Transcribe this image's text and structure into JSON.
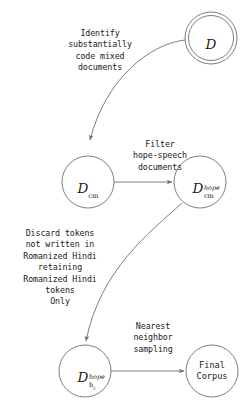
{
  "figure": {
    "type": "flow-diagram",
    "background_color": "#ffffff",
    "stroke_color": "#6e6e6e",
    "text_color": "#1a1a1a"
  },
  "nodes": [
    {
      "id": "D",
      "shape": "double-circle",
      "label_base": "D",
      "label_sup": "",
      "label_sub": "",
      "plain_label": "",
      "cx": 211,
      "cy": 38,
      "r": 26
    },
    {
      "id": "Dcm",
      "shape": "circle",
      "label_base": "D",
      "label_sup": "",
      "label_sub": "cm",
      "plain_label": "",
      "cx": 88,
      "cy": 182,
      "r": 26
    },
    {
      "id": "Dcm_hope",
      "shape": "circle",
      "label_base": "D",
      "label_sup": "hope",
      "label_sub": "cm",
      "plain_label": "",
      "cx": 200,
      "cy": 182,
      "r": 26
    },
    {
      "id": "Dh_hope",
      "shape": "circle",
      "label_base": "D",
      "label_sup": "hope",
      "label_sub": "h",
      "label_sub_sub": "r",
      "plain_label": "",
      "cx": 85,
      "cy": 371,
      "r": 26
    },
    {
      "id": "FinalCorpus",
      "shape": "circle",
      "label_base": "",
      "label_sup": "",
      "label_sub": "",
      "plain_label": "Final\nCorpus",
      "cx": 212,
      "cy": 371,
      "r": 26
    }
  ],
  "edges": [
    {
      "id": "e1",
      "from": "D",
      "to": "Dcm",
      "label": "Identify\nsubstantially\ncode mixed\ndocuments",
      "label_x": 50,
      "label_y": 28,
      "label_w": 100
    },
    {
      "id": "e2",
      "from": "Dcm",
      "to": "Dcm_hope",
      "label": "Filter\nhope-speech\ndocuments",
      "label_x": 116,
      "label_y": 139,
      "label_w": 88
    },
    {
      "id": "e3",
      "from": "Dcm_hope",
      "to": "Dh_hope",
      "label": "Discard tokens\nnot written in\nRomanized Hindi\nretaining\nRomanized Hindi\ntokens\nOnly",
      "label_x": 6,
      "label_y": 228,
      "label_w": 108
    },
    {
      "id": "e4",
      "from": "Dh_hope",
      "to": "FinalCorpus",
      "label": "Nearest\nneighbor\nsampling",
      "label_x": 113,
      "label_y": 321,
      "label_w": 80
    }
  ]
}
